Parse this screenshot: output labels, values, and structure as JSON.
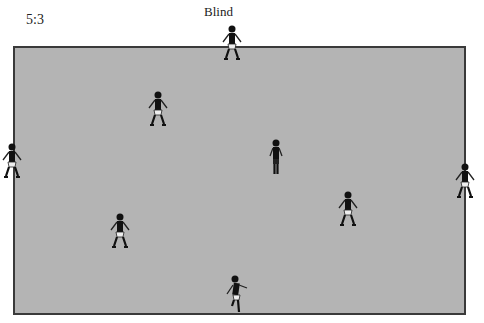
{
  "diagram": {
    "ratio_label": "5:3",
    "title": "Blind",
    "pitch": {
      "fill": "#b4b4b4",
      "border": "#3a3a3a"
    },
    "players": [
      {
        "id": "top-edge",
        "x": 232,
        "y": 44,
        "pose": "stance"
      },
      {
        "id": "upper-left",
        "x": 158,
        "y": 110,
        "pose": "stance"
      },
      {
        "id": "center",
        "x": 276,
        "y": 158,
        "pose": "standing"
      },
      {
        "id": "left-edge",
        "x": 12,
        "y": 162,
        "pose": "stance"
      },
      {
        "id": "right-edge",
        "x": 465,
        "y": 182,
        "pose": "stance"
      },
      {
        "id": "right-middle",
        "x": 348,
        "y": 210,
        "pose": "stance"
      },
      {
        "id": "lower-left",
        "x": 120,
        "y": 232,
        "pose": "stance"
      },
      {
        "id": "bottom-edge",
        "x": 236,
        "y": 294,
        "pose": "running"
      }
    ]
  }
}
